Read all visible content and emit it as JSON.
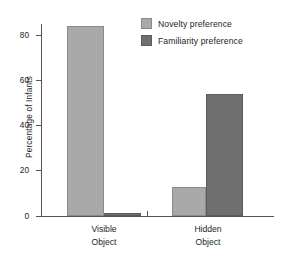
{
  "chart_data": {
    "type": "bar",
    "title": "",
    "xlabel": "",
    "ylabel": "Percentage of Infants",
    "ylim": [
      0,
      90
    ],
    "yticks": [
      0,
      20,
      40,
      60,
      80
    ],
    "ytick_labels": [
      "0",
      "20",
      "40",
      "60",
      "80"
    ],
    "grid": false,
    "categories": [
      "Visible Object",
      "Hidden Object"
    ],
    "category_lines": [
      [
        "Visible",
        "Object"
      ],
      [
        "Hidden",
        "Object"
      ]
    ],
    "series": [
      {
        "name": "Novelty preference",
        "color": "#a9a9a9",
        "values": [
          84,
          13
        ]
      },
      {
        "name": "Familiarity preference",
        "color": "#6f6f6f",
        "values": [
          1.5,
          54
        ]
      }
    ],
    "legend": {
      "position": "top-right",
      "entries": [
        {
          "label": "Novelty preference",
          "color": "#a9a9a9",
          "swatch": "light-gray-swatch"
        },
        {
          "label": "Familiarity preference",
          "color": "#6f6f6f",
          "swatch": "dark-gray-swatch"
        }
      ]
    }
  },
  "axis": {
    "y_label": "Percentage of Infants",
    "y_tick_0": "0",
    "y_tick_20": "20",
    "y_tick_40": "40",
    "y_tick_60": "60",
    "y_tick_80": "80"
  },
  "groups": {
    "g0_line1": "Visible",
    "g0_line2": "Object",
    "g1_line1": "Hidden",
    "g1_line2": "Object"
  },
  "legend": {
    "item0": "Novelty preference",
    "item1": "Familiarity preference"
  }
}
